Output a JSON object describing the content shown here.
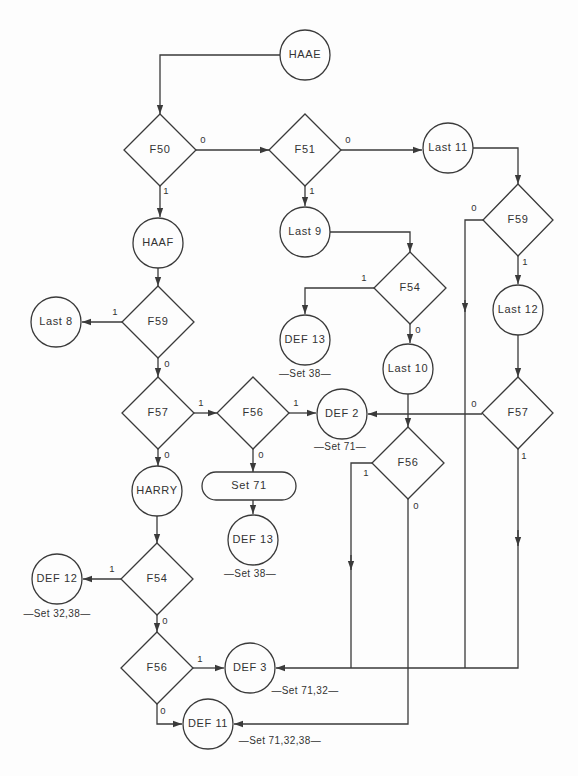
{
  "diagram": {
    "nodes": {
      "haae": {
        "label": "HAAE",
        "type": "circle"
      },
      "f50": {
        "label": "F50",
        "type": "decision"
      },
      "f51": {
        "label": "F51",
        "type": "decision"
      },
      "last11": {
        "label": "Last 11",
        "type": "circle"
      },
      "f59_right": {
        "label": "F59",
        "type": "decision"
      },
      "last9": {
        "label": "Last 9",
        "type": "circle"
      },
      "haaf": {
        "label": "HAAF",
        "type": "circle"
      },
      "f54_mid": {
        "label": "F54",
        "type": "decision"
      },
      "last8": {
        "label": "Last 8",
        "type": "circle"
      },
      "f59_left": {
        "label": "F59",
        "type": "decision"
      },
      "last12": {
        "label": "Last 12",
        "type": "circle"
      },
      "def13_upper": {
        "label": "DEF 13",
        "type": "circle",
        "note": "—Set 38—"
      },
      "last10": {
        "label": "Last 10",
        "type": "circle"
      },
      "f57_left": {
        "label": "F57",
        "type": "decision"
      },
      "f56_mid": {
        "label": "F56",
        "type": "decision"
      },
      "def2": {
        "label": "DEF 2",
        "type": "circle",
        "note": "—Set 71—"
      },
      "f57_right": {
        "label": "F57",
        "type": "decision"
      },
      "f56_right": {
        "label": "F56",
        "type": "decision"
      },
      "harry": {
        "label": "HARRY",
        "type": "circle"
      },
      "set71": {
        "label": "Set 71",
        "type": "process"
      },
      "def13_lower": {
        "label": "DEF 13",
        "type": "circle",
        "note": "—Set 38—"
      },
      "f54_lower": {
        "label": "F54",
        "type": "decision"
      },
      "def12": {
        "label": "DEF 12",
        "type": "circle",
        "note": "—Set 32,38—"
      },
      "f56_lower": {
        "label": "F56",
        "type": "decision"
      },
      "def3": {
        "label": "DEF 3",
        "type": "circle",
        "note": "—Set 71,32—"
      },
      "def11": {
        "label": "DEF 11",
        "type": "circle",
        "note": "—Set 71,32,38—"
      }
    },
    "edge_labels": {
      "zero": "0",
      "one": "1"
    },
    "edges": [
      {
        "from": "HAAE",
        "to": "F50",
        "label": ""
      },
      {
        "from": "F50",
        "to": "F51",
        "label": "0"
      },
      {
        "from": "F50",
        "to": "HAAF",
        "label": "1"
      },
      {
        "from": "F51",
        "to": "Last 11",
        "label": "0"
      },
      {
        "from": "F51",
        "to": "Last 9",
        "label": "1"
      },
      {
        "from": "Last 11",
        "to": "F59 (right)",
        "label": ""
      },
      {
        "from": "F59 (right)",
        "to": "DEF 3",
        "label": "0"
      },
      {
        "from": "F59 (right)",
        "to": "Last 12",
        "label": "1"
      },
      {
        "from": "Last 9",
        "to": "F54 (mid)",
        "label": ""
      },
      {
        "from": "F54 (mid)",
        "to": "DEF 13 (upper)",
        "label": "1"
      },
      {
        "from": "F54 (mid)",
        "to": "Last 10",
        "label": "0"
      },
      {
        "from": "HAAF",
        "to": "F59 (left)",
        "label": ""
      },
      {
        "from": "F59 (left)",
        "to": "Last 8",
        "label": "1"
      },
      {
        "from": "F59 (left)",
        "to": "F57 (left)",
        "label": "0"
      },
      {
        "from": "Last 12",
        "to": "F57 (right)",
        "label": ""
      },
      {
        "from": "Last 10",
        "to": "F56 (right)",
        "label": ""
      },
      {
        "from": "F57 (left)",
        "to": "F56 (mid)",
        "label": "1"
      },
      {
        "from": "F57 (left)",
        "to": "HARRY",
        "label": "0"
      },
      {
        "from": "F56 (mid)",
        "to": "DEF 2",
        "label": "1"
      },
      {
        "from": "F56 (mid)",
        "to": "Set 71",
        "label": "0"
      },
      {
        "from": "F57 (right)",
        "to": "DEF 2",
        "label": "0"
      },
      {
        "from": "F57 (right)",
        "to": "DEF 3",
        "label": "1"
      },
      {
        "from": "F56 (right)",
        "to": "DEF 3",
        "label": "1"
      },
      {
        "from": "F56 (right)",
        "to": "DEF 11",
        "label": "0"
      },
      {
        "from": "Set 71",
        "to": "DEF 13 (lower)",
        "label": ""
      },
      {
        "from": "HARRY",
        "to": "F54 (lower)",
        "label": ""
      },
      {
        "from": "F54 (lower)",
        "to": "DEF 12",
        "label": "1"
      },
      {
        "from": "F54 (lower)",
        "to": "F56 (lower)",
        "label": "0"
      },
      {
        "from": "F56 (lower)",
        "to": "DEF 3",
        "label": "1"
      },
      {
        "from": "F56 (lower)",
        "to": "DEF 11",
        "label": "0"
      }
    ]
  },
  "colors": {
    "line": "#3a3a3a",
    "background": "#fdfdfd",
    "text": "#333333"
  }
}
